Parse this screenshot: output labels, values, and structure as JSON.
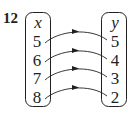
{
  "problem_number": "12",
  "domain_set": {
    "label": "x",
    "values": [
      "5",
      "6",
      "7",
      "8"
    ]
  },
  "codomain_set": {
    "label": "y",
    "values": [
      "5",
      "4",
      "3",
      "2"
    ]
  },
  "mappings": [
    {
      "from": "5",
      "to": "5"
    },
    {
      "from": "6",
      "to": "4"
    },
    {
      "from": "7",
      "to": "3"
    },
    {
      "from": "8",
      "to": "2"
    }
  ],
  "colors": {
    "ink": "#231f20",
    "background": "#ffffff"
  }
}
